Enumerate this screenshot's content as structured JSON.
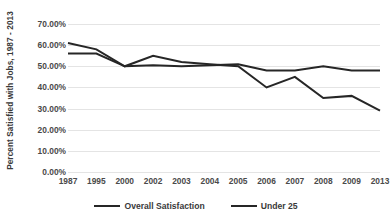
{
  "chart_data": {
    "type": "line",
    "title": "",
    "xlabel": "",
    "ylabel": "Percent Satisfied with Jobs, 1987 - 2013",
    "categories": [
      "1987",
      "1995",
      "2000",
      "2002",
      "2003",
      "2004",
      "2005",
      "2006",
      "2007",
      "2008",
      "2009",
      "2013"
    ],
    "ylim": [
      0,
      70
    ],
    "ytick_labels": [
      "70.00%",
      "60.00%",
      "50.00%",
      "40.00%",
      "30.00%",
      "20.00%",
      "10.00%",
      "0.00%"
    ],
    "ytick_values": [
      70,
      60,
      50,
      40,
      30,
      20,
      10,
      0
    ],
    "grid": true,
    "legend_position": "bottom",
    "series": [
      {
        "name": "Overall Satisfaction",
        "color": "#262626",
        "values": [
          56.0,
          56.0,
          50.0,
          50.5,
          50.0,
          50.5,
          51.0,
          48.0,
          48.0,
          50.0,
          48.0,
          48.0
        ]
      },
      {
        "name": "Under 25",
        "color": "#262626",
        "values": [
          61.0,
          58.0,
          50.0,
          55.0,
          52.0,
          51.0,
          50.0,
          40.0,
          45.0,
          35.0,
          36.0,
          29.0
        ]
      }
    ]
  },
  "legend": {
    "entries": [
      {
        "label": "Overall Satisfaction"
      },
      {
        "label": "Under 25"
      }
    ]
  }
}
